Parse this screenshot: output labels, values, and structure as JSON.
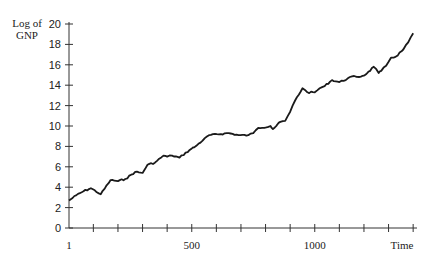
{
  "chart_data": {
    "type": "line",
    "title": "",
    "xlabel": "Time",
    "ylabel": "Log of GNP",
    "xlim": [
      1,
      1400
    ],
    "ylim": [
      0,
      20
    ],
    "grid": false,
    "legend": null,
    "x_tick_labels": [
      "1",
      "500",
      "1000"
    ],
    "x_ticks_minor_every": 100,
    "y_tick_labels": [
      "0",
      "2",
      "4",
      "6",
      "8",
      "10",
      "12",
      "14",
      "16",
      "18",
      "20"
    ],
    "series": [
      {
        "name": "Log of GNP",
        "x": [
          1,
          30,
          60,
          90,
          130,
          170,
          200,
          230,
          270,
          300,
          320,
          350,
          385,
          400,
          420,
          450,
          500,
          510,
          570,
          650,
          690,
          730,
          750,
          770,
          820,
          830,
          860,
          880,
          900,
          920,
          950,
          970,
          1000,
          1020,
          1040,
          1070,
          1100,
          1160,
          1180,
          1210,
          1240,
          1260,
          1270,
          1290,
          1310,
          1330,
          1360,
          1380,
          1400
        ],
        "values": [
          2.7,
          3.2,
          3.6,
          3.9,
          3.3,
          4.7,
          4.6,
          4.8,
          5.5,
          5.4,
          6.2,
          6.4,
          7.1,
          7.0,
          7.1,
          6.9,
          7.8,
          7.9,
          9.1,
          9.3,
          9.1,
          9.1,
          9.3,
          9.8,
          10.0,
          9.7,
          10.4,
          10.5,
          11.4,
          12.5,
          13.7,
          13.3,
          13.3,
          13.7,
          13.9,
          14.5,
          14.3,
          14.9,
          14.8,
          15.1,
          15.8,
          15.2,
          15.4,
          15.9,
          16.7,
          16.8,
          17.5,
          18.2,
          19.1
        ]
      }
    ]
  },
  "labels": {
    "ylabel_line1": "Log of",
    "ylabel_line2": "GNP",
    "xlabel": "Time"
  }
}
